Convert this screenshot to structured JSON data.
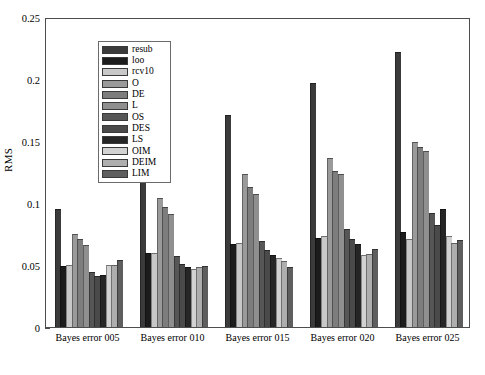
{
  "chart_data": {
    "type": "bar",
    "title": "",
    "xlabel": "",
    "ylabel": "RMS",
    "ylim": [
      0,
      0.25
    ],
    "yticks": [
      0,
      0.05,
      0.1,
      0.15,
      0.2,
      0.25
    ],
    "ytick_labels": [
      "0",
      "0.05",
      "0.1",
      "0.15",
      "0.2",
      "0.25"
    ],
    "grid": false,
    "legend_position": "upper-left-inside",
    "categories": [
      "Bayes error 005",
      "Bayes error 010",
      "Bayes error 015",
      "Bayes error 020",
      "Bayes error 025"
    ],
    "series": [
      {
        "name": "resub",
        "color": "#3b3b3b",
        "values": [
          0.095,
          0.141,
          0.171,
          0.197,
          0.222
        ]
      },
      {
        "name": "loo",
        "color": "#1c1c1c",
        "values": [
          0.049,
          0.06,
          0.067,
          0.072,
          0.077
        ]
      },
      {
        "name": "rcv10",
        "color": "#c8c8c8",
        "values": [
          0.05,
          0.06,
          0.068,
          0.073,
          0.071
        ]
      },
      {
        "name": "O",
        "color": "#9a9a9a",
        "values": [
          0.075,
          0.104,
          0.123,
          0.136,
          0.149
        ]
      },
      {
        "name": "DE",
        "color": "#7d7d7d",
        "values": [
          0.071,
          0.097,
          0.113,
          0.126,
          0.145
        ]
      },
      {
        "name": "L",
        "color": "#8f8f8f",
        "values": [
          0.066,
          0.091,
          0.107,
          0.123,
          0.142
        ]
      },
      {
        "name": "OS",
        "color": "#565656",
        "values": [
          0.044,
          0.057,
          0.069,
          0.079,
          0.092
        ]
      },
      {
        "name": "DES",
        "color": "#4a4a4a",
        "values": [
          0.041,
          0.051,
          0.062,
          0.071,
          0.082
        ]
      },
      {
        "name": "LS",
        "color": "#262626",
        "values": [
          0.042,
          0.048,
          0.058,
          0.067,
          0.095
        ]
      },
      {
        "name": "OIM",
        "color": "#d2d2d2",
        "values": [
          0.05,
          0.047,
          0.056,
          0.058,
          0.073
        ]
      },
      {
        "name": "DEIM",
        "color": "#aeaeae",
        "values": [
          0.05,
          0.048,
          0.053,
          0.059,
          0.068
        ]
      },
      {
        "name": "LIM",
        "color": "#5e5e5e",
        "values": [
          0.054,
          0.049,
          0.048,
          0.063,
          0.07
        ]
      }
    ]
  },
  "axis": {
    "y_title": "RMS"
  }
}
